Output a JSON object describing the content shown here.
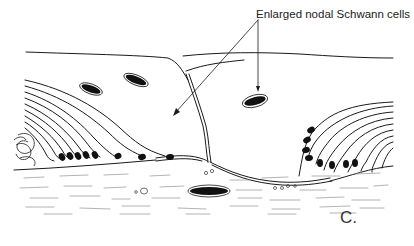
{
  "figure": {
    "callout_label": "Enlarged nodal Schwann cells",
    "panel_label": "C.",
    "colors": {
      "line": "#1a1a1a",
      "axon_dash": "#9a9a9a",
      "background": "#ffffff"
    }
  }
}
